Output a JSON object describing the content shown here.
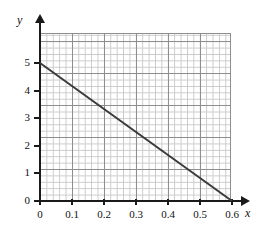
{
  "chart_data": {
    "type": "line",
    "title": "",
    "xlabel": "x",
    "ylabel": "y",
    "xlim": [
      0,
      0.7
    ],
    "ylim": [
      0,
      6
    ],
    "grid": true,
    "legend": null,
    "x_ticks": [
      0,
      0.1,
      0.2,
      0.3,
      0.4,
      0.5,
      0.6
    ],
    "x_ticklabels": [
      "0",
      "0.1",
      "0.2",
      "0.3",
      "0.4",
      "0.5",
      "0.6"
    ],
    "y_ticks": [
      0,
      1,
      2,
      3,
      4,
      5
    ],
    "y_ticklabels": [
      "0",
      "1",
      "2",
      "3",
      "4",
      "5"
    ],
    "series": [
      {
        "name": "line",
        "color": "#3a3a3a",
        "x": [
          0,
          0.6
        ],
        "y": [
          5,
          0
        ],
        "points": [
          {
            "x": 0,
            "y": 5
          },
          {
            "x": 0.6,
            "y": 0
          }
        ]
      }
    ]
  },
  "axes": {
    "x_name": "x",
    "y_name": "y"
  },
  "colors": {
    "line": "#3a3a3a",
    "axis": "#1a1a1a",
    "grid_minor": "#c9c9c9",
    "grid_major": "#8e8e8e",
    "background": "#ffffff"
  }
}
